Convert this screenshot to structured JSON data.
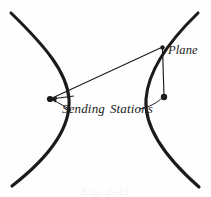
{
  "figure": {
    "background_color": "#fefefe",
    "ink_color": "#1b1b1b",
    "width": 211,
    "height": 197,
    "labels": {
      "stations": "Sending",
      "stations_second": "Stations",
      "plane": "Plane"
    },
    "caption": "Fig. 2-11",
    "points": [
      {
        "name": "left-sending-station",
        "x": 50,
        "y": 99
      },
      {
        "name": "right-sending-station",
        "x": 164,
        "y": 97
      },
      {
        "name": "plane",
        "x": 162,
        "y": 47
      }
    ],
    "curves": [
      {
        "name": "left-hyperbola-branch",
        "description": "left branch opening to the left",
        "path": "M 11 13 C 45 46, 67 72, 69 99 C 71 128, 48 158, 12 186"
      },
      {
        "name": "right-hyperbola-branch",
        "description": "right branch opening to the right",
        "path": "M 198 13 C 168 42, 148 72, 146 99 C 144 128, 166 158, 199 187"
      }
    ],
    "connectors": [
      {
        "name": "baseline-left-station-to-plane",
        "from": "left-sending-station",
        "to": "plane"
      },
      {
        "name": "right-station-to-plane",
        "from": "right-sending-station",
        "to": "plane"
      }
    ],
    "leaders": [
      {
        "name": "leader-upper-to-left-station",
        "arrow": true
      },
      {
        "name": "leader-lower-to-left-station",
        "arrow": true
      },
      {
        "name": "leader-to-right-station",
        "arrow": false
      }
    ]
  }
}
